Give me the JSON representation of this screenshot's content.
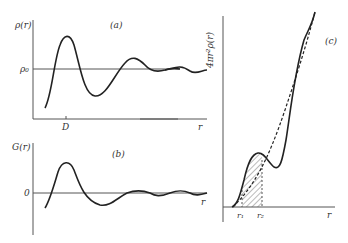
{
  "panel_a": {
    "label": "(a)",
    "ylabel": "ρ(r)",
    "y_ref_label": "ρ₀",
    "x_tick_label": "D",
    "xlabel": "r"
  },
  "panel_b": {
    "label": "(b)",
    "ylabel": "G(r)",
    "y_ref_label": "0",
    "xlabel": "r"
  },
  "panel_c": {
    "label": "(c)",
    "ylabel": "4πr²ρ(r)",
    "x_tick_labels": [
      "r₁",
      "r₂"
    ],
    "xlabel": "r"
  },
  "colors": {
    "ink": "#222222",
    "axis": "#555555"
  }
}
